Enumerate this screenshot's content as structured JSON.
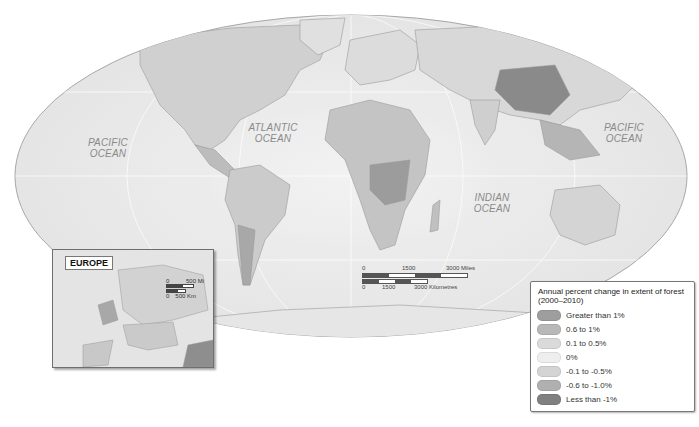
{
  "map": {
    "projection": "world-ellipse",
    "oceans": [
      {
        "id": "pacific-west",
        "line1": "PACIFIC",
        "line2": "OCEAN"
      },
      {
        "id": "atlantic",
        "line1": "ATLANTIC",
        "line2": "OCEAN"
      },
      {
        "id": "indian",
        "line1": "INDIAN",
        "line2": "OCEAN"
      },
      {
        "id": "pacific-east",
        "line1": "PACIFIC",
        "line2": "OCEAN"
      }
    ]
  },
  "inset": {
    "title": "EUROPE",
    "scale_mi_start": "0",
    "scale_mi_end": "500 Mi",
    "scale_km_start": "0",
    "scale_km_end": "500 Km"
  },
  "scalebar": {
    "miles": [
      "0",
      "1500",
      "3000 Miles"
    ],
    "km": [
      "0",
      "1500",
      "3000 Kilometres"
    ]
  },
  "legend": {
    "title": "Annual percent change in extent of forest (2000–2010)",
    "items": [
      {
        "label": "Greater than 1%",
        "color": "#9e9e9e"
      },
      {
        "label": "0.6 to 1%",
        "color": "#b8b8b8"
      },
      {
        "label": "0.1 to 0.5%",
        "color": "#dadada"
      },
      {
        "label": "0%",
        "color": "#eeeeee"
      },
      {
        "label": "-0.1 to -0.5%",
        "color": "#d4d4d4"
      },
      {
        "label": "-0.6 to -1.0%",
        "color": "#b0b0b0"
      },
      {
        "label": "Less than -1%",
        "color": "#808080"
      }
    ]
  },
  "colors": {
    "ocean": "#ececec",
    "land": "#d6d6d6",
    "outline": "#9a9a9a"
  }
}
